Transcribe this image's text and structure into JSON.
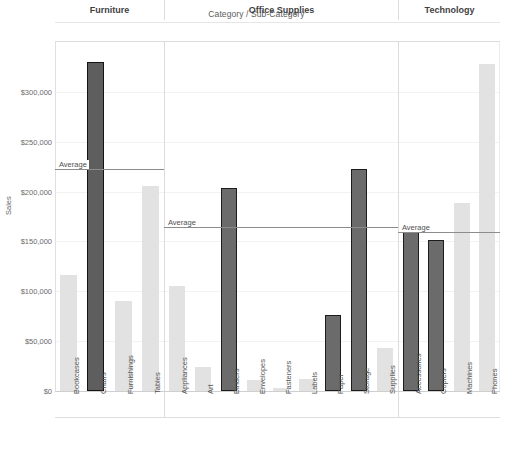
{
  "chart_data": {
    "type": "bar",
    "title": "Category / Sub-Category",
    "xlabel": "",
    "ylabel": "Sales",
    "ylim": [
      0,
      340000
    ],
    "grid": true,
    "legend": "none",
    "y_ticks": [
      "$0",
      "$50,000",
      "$100,000",
      "$150,000",
      "$200,000",
      "$250,000",
      "$300,000"
    ],
    "y_tick_values": [
      0,
      50000,
      100000,
      150000,
      200000,
      250000,
      300000
    ],
    "panels": [
      {
        "name": "Furniture",
        "average_label": "Average",
        "average_value": 223000,
        "categories": [
          "Bookcases",
          "Chairs",
          "Furnishings",
          "Tables"
        ],
        "values": [
          116000,
          330000,
          90000,
          206000
        ],
        "above_average": [
          false,
          true,
          false,
          false
        ]
      },
      {
        "name": "Office Supplies",
        "average_label": "Average",
        "average_value": 165000,
        "categories": [
          "Appliances",
          "Art",
          "Binders",
          "Envelopes",
          "Fasteners",
          "Labels",
          "Paper",
          "Storage",
          "Supplies"
        ],
        "values": [
          105000,
          24000,
          204000,
          11000,
          3000,
          12000,
          76000,
          223000,
          43000
        ],
        "above_average": [
          false,
          false,
          true,
          false,
          false,
          false,
          true,
          true,
          false
        ]
      },
      {
        "name": "Technology",
        "average_label": "Average",
        "average_value": 159000,
        "categories": [
          "Accessories",
          "Copiers",
          "Machines",
          "Phones"
        ],
        "values": [
          167000,
          151000,
          189000,
          328000
        ],
        "above_average": [
          true,
          true,
          false,
          false
        ]
      }
    ],
    "colors": {
      "bar_above_average": "#6b6b6b",
      "bar_above_average_border": "#1c1c1c",
      "bar_below_average": "#e2e2e2",
      "average_line": "#8c8c8c",
      "gridline": "#f2f2f2",
      "text": "#4a4a4a",
      "background": "#ffffff"
    }
  }
}
